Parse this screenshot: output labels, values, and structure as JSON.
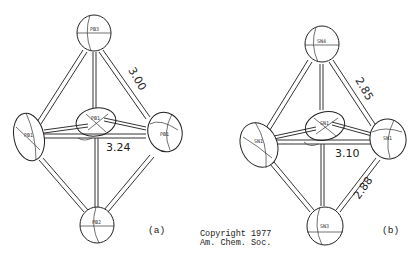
{
  "figure": {
    "panels": [
      {
        "id": "a",
        "panel_label": "(a)",
        "atoms": {
          "top": "PB3",
          "left": "PB1",
          "right": "PB1",
          "center": "PB1",
          "bottom": "PB2"
        },
        "distances": {
          "top_right_edge": "3.00",
          "equatorial": "3.24"
        }
      },
      {
        "id": "b",
        "panel_label": "(b)",
        "atoms": {
          "top": "SN4",
          "left": "SN1",
          "right": "SN1",
          "center": "SN1",
          "bottom": "SN3"
        },
        "distances": {
          "top_right_edge": "2.85",
          "equatorial": "3.10",
          "bottom_right_edge": "2.88"
        }
      }
    ],
    "copyright": {
      "line1": "Copyright 1977",
      "line2": "Am. Chem. Soc."
    }
  }
}
